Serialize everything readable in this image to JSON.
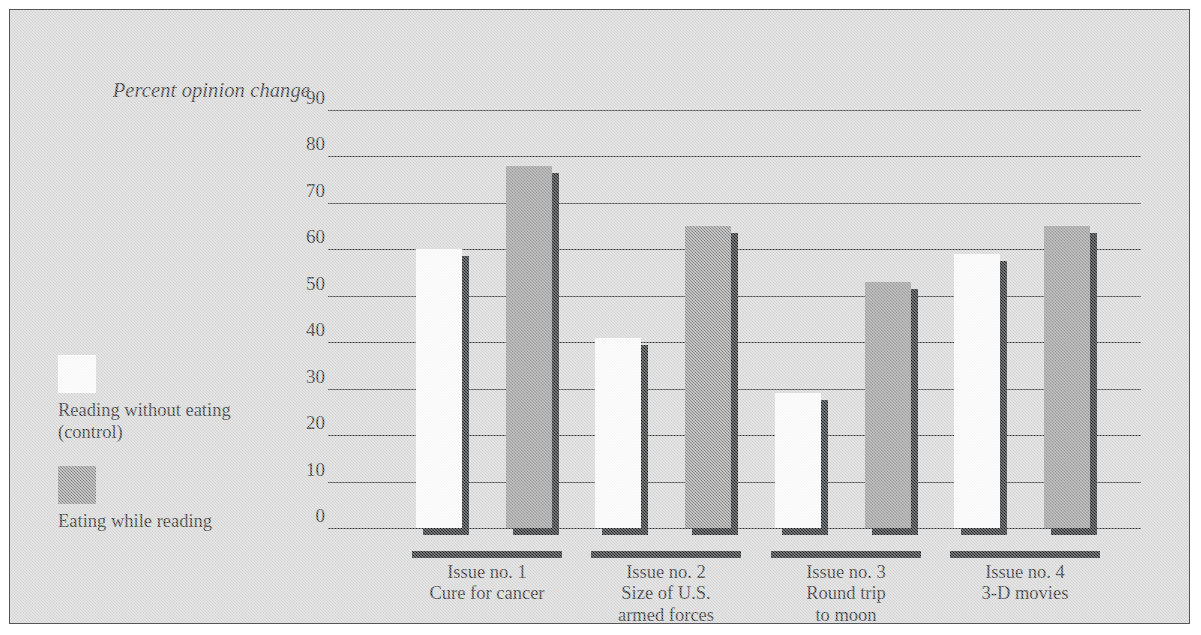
{
  "chart_data": {
    "type": "bar",
    "title": "",
    "subtitle": "",
    "xlabel": "",
    "ylabel": "Percent opinion change",
    "ylim": [
      0,
      90
    ],
    "yticks": [
      90,
      80,
      70,
      60,
      50,
      40,
      30,
      20,
      10,
      0
    ],
    "grid": "horizontal",
    "legend_position": "left",
    "categories": [
      "Issue no. 1\nCure for cancer",
      "Issue no. 2\nSize of U.S.\narmed forces",
      "Issue no. 3\nRound trip\nto moon",
      "Issue no. 4\n3-D movies"
    ],
    "series": [
      {
        "name": "Reading without eating\n(control)",
        "color": "#fdfdfd",
        "values": [
          60,
          41,
          29,
          59
        ]
      },
      {
        "name": "Eating while reading",
        "color": "#8c8c8c",
        "values": [
          78,
          65,
          53,
          65
        ]
      }
    ]
  },
  "axis": {
    "title": "Percent opinion change",
    "ticks": [
      "90",
      "80",
      "70",
      "60",
      "50",
      "40",
      "30",
      "20",
      "10",
      "0"
    ]
  },
  "legend": {
    "entries": [
      {
        "label": "Reading without eating\n(control)",
        "swatch": "white-swatch"
      },
      {
        "label": "Eating while reading",
        "swatch": "gray-swatch"
      }
    ]
  },
  "groups": [
    {
      "line1": "Issue no. 1",
      "line2": "Cure for cancer",
      "line3": ""
    },
    {
      "line1": "Issue no. 2",
      "line2": "Size of U.S.",
      "line3": "armed forces"
    },
    {
      "line1": "Issue no. 3",
      "line2": "Round trip",
      "line3": "to moon"
    },
    {
      "line1": "Issue no. 4",
      "line2": "3-D movies",
      "line3": ""
    }
  ],
  "colors": {
    "background": "#d3d3d3",
    "frame": "#55565a",
    "ink": "#121315",
    "control_bar": "#fdfdfd",
    "eating_bar": "#8c8c8c",
    "shadow": "#111214"
  }
}
